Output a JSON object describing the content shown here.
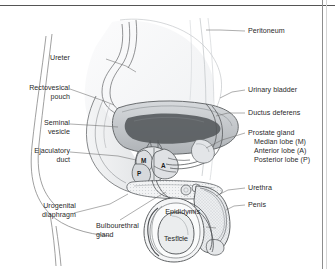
{
  "figure": {
    "border_color": "#8e8e8e",
    "ink_color": "#3a3a3a"
  },
  "labels": {
    "ureter": "Ureter",
    "rectovesical_pouch": "Rectovesical\npouch",
    "seminal_vesicle": "Seminal\nvesicle",
    "ejaculatory_duct": "Ejaculatory\nduct",
    "urogenital_diaphragm": "Urogenital\ndiaphragm",
    "bulbourethral_gland": "Bulbourethral\ngland",
    "epididymis": "Epididymis",
    "testicle": "Testicle",
    "peritoneum": "Peritoneum",
    "urinary_bladder": "Urinary bladder",
    "ductus_deferens": "Ductus deferens",
    "prostate_gland": "Prostate gland",
    "median_lobe": "Median lobe (M)",
    "anterior_lobe": "Anterior lobe (A)",
    "posterior_lobe": "Posterior lobe (P)",
    "urethra": "Urethra",
    "penis": "Penis"
  },
  "lobe_markers": {
    "median": "M",
    "anterior": "A",
    "posterior": "P"
  },
  "colors": {
    "bladder_fill": "#b9bcbf",
    "prostate_fill": "#6f7478",
    "tissue_light": "#e9eaec",
    "outline": "#4a4a4a",
    "leader_line": "#6a6a6a"
  }
}
